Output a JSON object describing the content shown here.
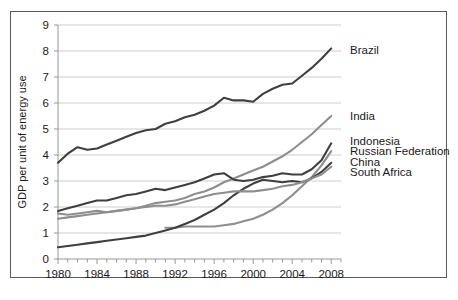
{
  "chart_data": {
    "type": "line",
    "title": "",
    "xlabel": "",
    "ylabel": "GDP per unit of energy use",
    "xlim": [
      1980,
      2009
    ],
    "ylim": [
      0,
      9
    ],
    "grid": true,
    "legend_position": "right-inline",
    "x_ticks": [
      1980,
      1984,
      1988,
      1992,
      1996,
      2000,
      2004,
      2008
    ],
    "x_minor_ticks": [
      1981,
      1982,
      1983,
      1985,
      1986,
      1987,
      1989,
      1990,
      1991,
      1993,
      1994,
      1995,
      1997,
      1998,
      1999,
      2001,
      2002,
      2003,
      2005,
      2006,
      2007,
      2009
    ],
    "y_ticks": [
      0,
      1,
      2,
      3,
      4,
      5,
      6,
      7,
      8,
      9
    ],
    "x": [
      1980,
      1981,
      1982,
      1983,
      1984,
      1985,
      1986,
      1987,
      1988,
      1989,
      1990,
      1991,
      1992,
      1993,
      1994,
      1995,
      1996,
      1997,
      1998,
      1999,
      2000,
      2001,
      2002,
      2003,
      2004,
      2005,
      2006,
      2007,
      2008
    ],
    "series": [
      {
        "name": "Brazil",
        "color": "#3f3f3f",
        "label_y": 8.05,
        "values": [
          3.7,
          4.05,
          4.3,
          4.2,
          4.25,
          4.4,
          4.55,
          4.7,
          4.85,
          4.95,
          5.0,
          5.2,
          5.3,
          5.45,
          5.55,
          5.7,
          5.9,
          6.2,
          6.1,
          6.1,
          6.05,
          6.35,
          6.55,
          6.7,
          6.75,
          7.05,
          7.35,
          7.7,
          8.1
        ]
      },
      {
        "name": "India",
        "color": "#8e8e8e",
        "label_y": 5.5,
        "values": [
          1.55,
          1.6,
          1.65,
          1.7,
          1.75,
          1.8,
          1.85,
          1.9,
          1.95,
          2.05,
          2.15,
          2.2,
          2.25,
          2.35,
          2.5,
          2.6,
          2.75,
          2.95,
          3.1,
          3.25,
          3.4,
          3.55,
          3.75,
          3.95,
          4.2,
          4.5,
          4.8,
          5.15,
          5.5
        ]
      },
      {
        "name": "Indonesia",
        "color": "#3f3f3f",
        "label_y": 4.55,
        "values": [
          1.85,
          1.95,
          2.05,
          2.15,
          2.25,
          2.25,
          2.35,
          2.45,
          2.5,
          2.6,
          2.7,
          2.65,
          2.75,
          2.85,
          2.95,
          3.1,
          3.25,
          3.3,
          3.05,
          3.0,
          3.05,
          3.15,
          3.2,
          3.3,
          3.25,
          3.25,
          3.45,
          3.8,
          4.45
        ]
      },
      {
        "name": "Russian Federation",
        "color": "#8e8e8e",
        "label_y": 4.15,
        "start_year": 1991,
        "values": [
          null,
          null,
          null,
          null,
          null,
          null,
          null,
          null,
          null,
          null,
          null,
          1.2,
          1.2,
          1.25,
          1.25,
          1.25,
          1.25,
          1.3,
          1.35,
          1.45,
          1.55,
          1.7,
          1.9,
          2.15,
          2.45,
          2.8,
          3.15,
          3.6,
          4.15
        ]
      },
      {
        "name": "China",
        "color": "#3f3f3f",
        "label_y": 3.75,
        "values": [
          0.45,
          0.5,
          0.55,
          0.6,
          0.65,
          0.7,
          0.75,
          0.8,
          0.85,
          0.9,
          1.0,
          1.1,
          1.2,
          1.35,
          1.5,
          1.7,
          1.9,
          2.15,
          2.45,
          2.7,
          2.9,
          3.05,
          3.0,
          2.95,
          3.0,
          2.95,
          3.1,
          3.35,
          3.7
        ]
      },
      {
        "name": "South Africa",
        "color": "#8e8e8e",
        "label_y": 3.35,
        "values": [
          1.75,
          1.7,
          1.75,
          1.8,
          1.85,
          1.8,
          1.85,
          1.9,
          1.95,
          2.0,
          2.05,
          2.05,
          2.1,
          2.2,
          2.3,
          2.4,
          2.5,
          2.55,
          2.6,
          2.6,
          2.6,
          2.65,
          2.7,
          2.8,
          2.85,
          2.95,
          3.1,
          3.25,
          3.55
        ]
      }
    ]
  }
}
